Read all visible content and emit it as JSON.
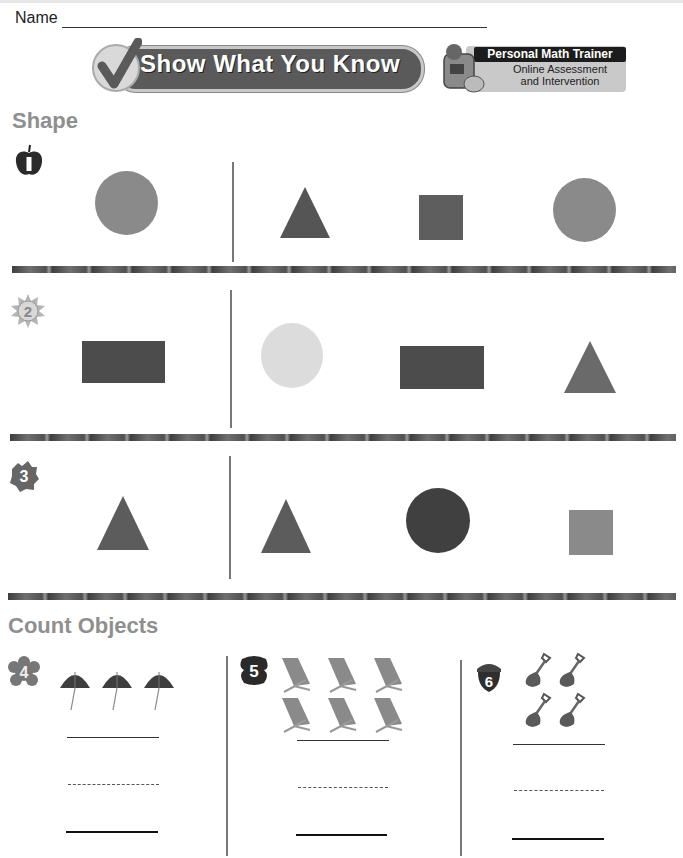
{
  "header": {
    "name_label": "Name",
    "banner_title": "Show What You Know",
    "pmt": {
      "title": "Personal Math Trainer",
      "subtitle_line1": "Online Assessment",
      "subtitle_line2": "and Intervention"
    }
  },
  "sections": {
    "shape": {
      "title": "Shape",
      "problems": [
        {
          "number": "1",
          "badge_icon": "apple-icon",
          "model": "circle",
          "choices": [
            "triangle",
            "square",
            "circle"
          ]
        },
        {
          "number": "2",
          "badge_icon": "sun-icon",
          "model": "rectangle",
          "choices": [
            "circle",
            "rectangle",
            "triangle"
          ]
        },
        {
          "number": "3",
          "badge_icon": "leaf-icon",
          "model": "triangle",
          "choices": [
            "triangle",
            "circle",
            "square"
          ]
        }
      ]
    },
    "count_objects": {
      "title": "Count Objects",
      "problems": [
        {
          "number": "4",
          "badge_icon": "flower-icon",
          "object": "beach umbrella",
          "count": 3
        },
        {
          "number": "5",
          "badge_icon": "butterfly-icon",
          "object": "beach chair",
          "count": 6
        },
        {
          "number": "6",
          "badge_icon": "acorn-icon",
          "object": "sand shovel",
          "count": 4
        }
      ]
    }
  },
  "colors": {
    "text": "#222222",
    "section_title": "#8f8f8f",
    "shape_light": "#8a8a8a",
    "shape_dark": "#555555",
    "shape_pale": "#dcdcdc"
  }
}
